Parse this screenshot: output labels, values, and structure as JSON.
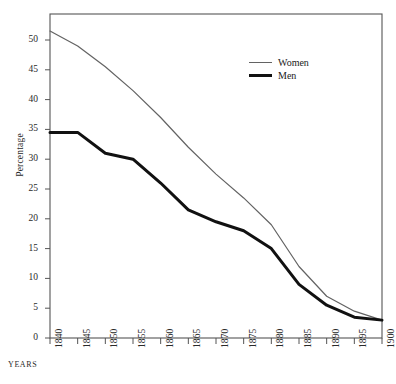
{
  "figure": {
    "caption_sliver": "",
    "yaxis_title": "Percentage",
    "xaxis_title": "YEARS"
  },
  "legend": {
    "position": "inside-top-right",
    "entries": [
      {
        "label": "Women",
        "color": "#636363",
        "width": 1.2
      },
      {
        "label": "Men",
        "color": "#111111",
        "width": 3.0
      }
    ]
  },
  "axes": {
    "y_ticks": [
      "50",
      "45",
      "40",
      "35",
      "30",
      "25",
      "20",
      "15",
      "10",
      "5",
      "0"
    ],
    "x_ticks": [
      "1840",
      "1845",
      "1850",
      "1855",
      "1860",
      "1865",
      "1870",
      "1875",
      "1880",
      "1885",
      "1890",
      "1895",
      "1900"
    ]
  },
  "chart_data": {
    "type": "line",
    "title": "",
    "subtitle": "",
    "xlabel": "YEARS",
    "ylabel": "Percentage",
    "x": [
      1840,
      1845,
      1850,
      1855,
      1860,
      1865,
      1870,
      1875,
      1880,
      1885,
      1890,
      1895,
      1900
    ],
    "xlim": [
      1840,
      1900
    ],
    "ylim": [
      0,
      53
    ],
    "y_ticks": [
      0,
      5,
      10,
      15,
      20,
      25,
      30,
      35,
      40,
      45,
      50
    ],
    "x_ticks": [
      1840,
      1845,
      1850,
      1855,
      1860,
      1865,
      1870,
      1875,
      1880,
      1885,
      1890,
      1895,
      1900
    ],
    "grid": false,
    "legend_position": "inside-top-right",
    "series": [
      {
        "name": "Women",
        "color": "#636363",
        "line_width": 1.2,
        "values": [
          51.5,
          49.0,
          45.5,
          41.5,
          37.0,
          32.0,
          27.5,
          23.5,
          19.0,
          12.0,
          7.0,
          4.5,
          3.0
        ]
      },
      {
        "name": "Men",
        "color": "#111111",
        "line_width": 3.0,
        "values": [
          34.5,
          34.5,
          31.0,
          30.0,
          26.0,
          21.5,
          19.5,
          18.0,
          15.0,
          9.0,
          5.5,
          3.5,
          3.0
        ]
      }
    ]
  }
}
